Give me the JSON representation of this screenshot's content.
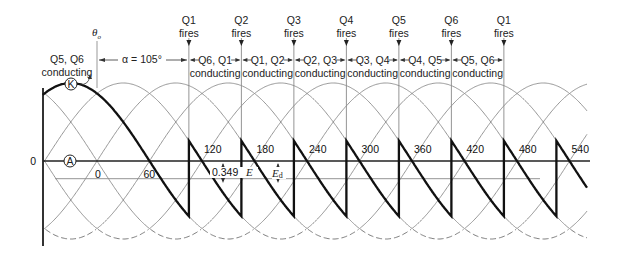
{
  "chart_data": {
    "type": "line",
    "xlabel": "electrical angle (degrees)",
    "ylabel": "",
    "x_tick_labels": [
      "0",
      "60",
      "120",
      "180",
      "240",
      "300",
      "360",
      "420",
      "480",
      "540"
    ],
    "x_ticks": [
      0,
      60,
      120,
      180,
      240,
      300,
      360,
      420,
      480,
      540
    ],
    "y_zero_label": "0",
    "xlim": [
      -62,
      560
    ],
    "ylim": [
      -1.0,
      1.0
    ],
    "line_voltage_series": {
      "description": "Six line-to-line sine waves 60 degrees apart (upper halves solid, lower halves dashed at bottom)",
      "phase_offsets_deg": [
        0,
        60,
        120,
        180,
        240,
        300
      ],
      "amplitude": 1.0
    },
    "output_series": {
      "name": "Ed (output voltage)",
      "firing_angle_deg": 105,
      "start_deg": -62,
      "end_deg": 560,
      "initial_phase_deg": 120
    },
    "average_line": {
      "label": "Ed",
      "value": -0.349,
      "value_label": "0.349",
      "e_label": "E"
    },
    "point_labels": {
      "K": "K",
      "A": "A"
    },
    "theta_label": "θ",
    "theta_sub": "o",
    "alpha_label": "α = 105°",
    "initial_conducting": {
      "line1": "Q5, Q6",
      "line2": "conducting"
    },
    "firing_events": [
      {
        "q": "Q1",
        "fires": "fires",
        "angle": 105,
        "conducting": "Q6, Q1"
      },
      {
        "q": "Q2",
        "fires": "fires",
        "angle": 165,
        "conducting": "Q1, Q2"
      },
      {
        "q": "Q3",
        "fires": "fires",
        "angle": 225,
        "conducting": "Q2, Q3"
      },
      {
        "q": "Q4",
        "fires": "fires",
        "angle": 285,
        "conducting": "Q3, Q4"
      },
      {
        "q": "Q5",
        "fires": "fires",
        "angle": 345,
        "conducting": "Q4, Q5"
      },
      {
        "q": "Q6",
        "fires": "fires",
        "angle": 405,
        "conducting": "Q5, Q6"
      },
      {
        "q": "Q1",
        "fires": "fires",
        "angle": 465,
        "conducting": ""
      }
    ],
    "conducting_word": "conducting"
  }
}
